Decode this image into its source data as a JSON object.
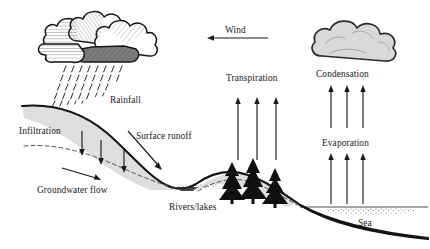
{
  "diagram": {
    "type": "hydrological-cycle-diagram",
    "background_color": "#ffffff",
    "ink_color": "#141414",
    "soil_color": "#dedede",
    "cloud_gray": "#d9d9d9"
  },
  "labels": {
    "rainfall": "Rainfall",
    "infiltration": "Infiltration",
    "surface_runoff": "Surface runoff",
    "groundwater_flow": "Groundwater flow",
    "rivers_lakes": "Rivers/lakes",
    "wind": "Wind",
    "transpiration": "Transpiration",
    "condensation": "Condensation",
    "evaporation": "Evaporation",
    "sea": "Sea"
  },
  "icons": {
    "rain_cloud": "rain-cloud-icon",
    "condensation_cloud": "cloud-icon",
    "trees": "conifer-tree-icon",
    "rain": "rain-drops-icon"
  },
  "flows": [
    {
      "name": "rainfall",
      "label": "Rainfall",
      "direction": "down",
      "count": 0
    },
    {
      "name": "infiltration",
      "label": "Infiltration",
      "direction": "down",
      "count": 3
    },
    {
      "name": "surface-runoff",
      "label": "Surface runoff",
      "direction": "down-right",
      "count": 1
    },
    {
      "name": "groundwater-flow",
      "label": "Groundwater flow",
      "direction": "right",
      "count": 1
    },
    {
      "name": "wind",
      "label": "Wind",
      "direction": "left",
      "count": 1
    },
    {
      "name": "transpiration",
      "label": "Transpiration",
      "direction": "up",
      "count": 3
    },
    {
      "name": "evaporation-lower",
      "label": "Evaporation",
      "direction": "up",
      "count": 3
    },
    {
      "name": "evaporation-upper",
      "label": "Condensation",
      "direction": "up",
      "count": 3
    }
  ],
  "water_bodies": [
    {
      "name": "rivers-lakes",
      "label": "Rivers/lakes"
    },
    {
      "name": "sea",
      "label": "Sea"
    }
  ]
}
